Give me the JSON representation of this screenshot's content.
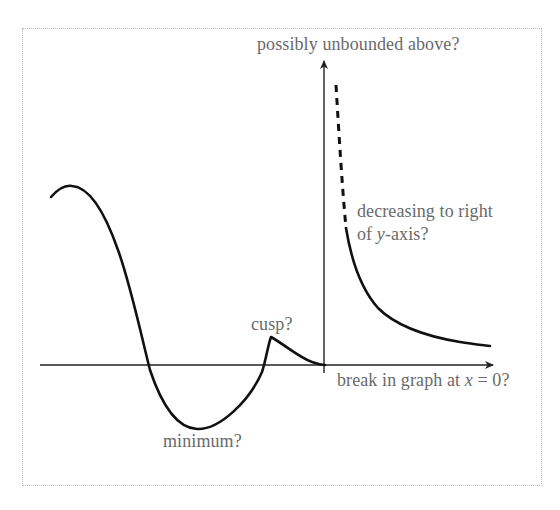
{
  "diagram": {
    "type": "annotated function sketch",
    "labels": {
      "unbounded": "possibly unbounded above?",
      "decreasing_line1": "decreasing to right",
      "decreasing_line2_prefix": "of ",
      "decreasing_line2_var": "y",
      "decreasing_line2_suffix": "-axis?",
      "cusp": "cusp?",
      "break_prefix": "break in graph at ",
      "break_var": "x",
      "break_suffix": " = 0?",
      "minimum": "minimum?"
    },
    "colors": {
      "curve": "#111111",
      "axes": "#222222",
      "label_text": "#6a6a6a",
      "frame_border": "#b8b8b8"
    },
    "axes": {
      "x_axis": {
        "from": [
          40,
          365
        ],
        "to": [
          494,
          365
        ],
        "arrow": "right"
      },
      "y_axis": {
        "from": [
          324,
          372
        ],
        "to": [
          324,
          60
        ],
        "arrow": "up"
      }
    },
    "curve_left": {
      "features": [
        "local maximum near left edge",
        "crosses x-axis",
        "minimum below x-axis",
        "crosses x-axis",
        "cusp above x-axis",
        "decays to origin"
      ],
      "key_points": [
        [
          51,
          197
        ],
        [
          70,
          186
        ],
        [
          148,
          366
        ],
        [
          197,
          429
        ],
        [
          265,
          366
        ],
        [
          271,
          337
        ],
        [
          325,
          365
        ]
      ]
    },
    "curve_right": {
      "dashed_segment": {
        "from": [
          336,
          85
        ],
        "to": [
          346,
          228
        ]
      },
      "solid_segment_key_points": [
        [
          346,
          228
        ],
        [
          370,
          300
        ],
        [
          420,
          335
        ],
        [
          490,
          346
        ]
      ]
    }
  }
}
